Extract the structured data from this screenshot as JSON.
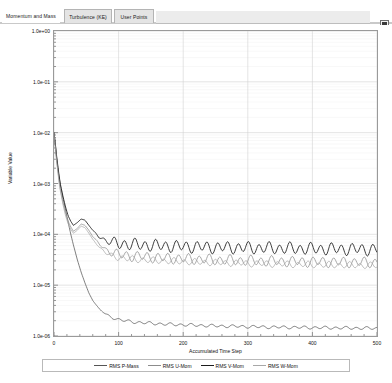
{
  "window": {
    "close_button_icon": "maximize-restore-icon"
  },
  "tabs": [
    {
      "label": "Momentum and Mass",
      "active": true
    },
    {
      "label": "Turbulence (KE)",
      "active": false
    },
    {
      "label": "User Points",
      "active": false
    }
  ],
  "chart_data": {
    "type": "line",
    "title": "",
    "xlabel": "Accumulated Time Step",
    "ylabel": "Variable Value",
    "xlim": [
      0,
      500
    ],
    "ylim": [
      1e-06,
      1.0
    ],
    "yscale": "log",
    "xticks": [
      0,
      100,
      200,
      300,
      400,
      500
    ],
    "xticklabels": [
      "0",
      "100",
      "200",
      "300",
      "400",
      "500"
    ],
    "yticks": [
      1.0,
      0.1,
      0.01,
      0.001,
      0.0001,
      1e-05,
      1e-06
    ],
    "yticklabels": [
      "1.0e+00",
      "1.0e-01",
      "1.0e-02",
      "1.0e-03",
      "1.0e-04",
      "1.0e-05",
      "1.0e-06"
    ],
    "grid": true,
    "legend_position": "bottom",
    "series": [
      {
        "name": "RMS P-Mass",
        "color": "#555555",
        "x": [
          0,
          2,
          4,
          6,
          8,
          10,
          14,
          18,
          22,
          26,
          30,
          36,
          42,
          48,
          54,
          60,
          70,
          80,
          90,
          100,
          115,
          130,
          145,
          160,
          175,
          190,
          205,
          220,
          235,
          250,
          270,
          290,
          310,
          330,
          350,
          370,
          390,
          410,
          430,
          450,
          470,
          490,
          500
        ],
        "y": [
          0.01,
          0.006,
          0.0032,
          0.002,
          0.0013,
          0.0009,
          0.0005,
          0.0003,
          0.00017,
          0.0001,
          6.2e-05,
          3.2e-05,
          1.8e-05,
          1.1e-05,
          7e-06,
          5e-06,
          3.4e-06,
          2.7e-06,
          2.3e-06,
          2.1e-06,
          1.95e-06,
          1.85e-06,
          1.8e-06,
          1.75e-06,
          1.7e-06,
          1.68e-06,
          1.65e-06,
          1.63e-06,
          1.6e-06,
          1.58e-06,
          1.56e-06,
          1.54e-06,
          1.52e-06,
          1.5e-06,
          1.49e-06,
          1.48e-06,
          1.47e-06,
          1.46e-06,
          1.45e-06,
          1.44e-06,
          1.43e-06,
          1.42e-06,
          1.42e-06
        ]
      },
      {
        "name": "RMS U-Mom",
        "color": "#8c8c8c",
        "x": [
          0,
          2,
          4,
          6,
          8,
          10,
          14,
          18,
          22,
          26,
          30,
          36,
          42,
          48,
          54,
          60,
          70,
          80,
          90,
          100,
          115,
          130,
          145,
          160,
          175,
          190,
          205,
          220,
          235,
          250,
          270,
          290,
          310,
          330,
          350,
          370,
          390,
          410,
          430,
          450,
          470,
          490,
          500
        ],
        "y": [
          0.01,
          0.0055,
          0.003,
          0.0018,
          0.0011,
          0.00075,
          0.00042,
          0.00026,
          0.00018,
          0.00014,
          0.000115,
          0.00013,
          0.00016,
          0.00015,
          0.00012,
          9e-05,
          6.5e-05,
          5e-05,
          4.4e-05,
          4e-05,
          3.8e-05,
          3.7e-05,
          3.6e-05,
          3.5e-05,
          3.4e-05,
          3.35e-05,
          3.3e-05,
          3.25e-05,
          3.2e-05,
          3.15e-05,
          3.1e-05,
          3.05e-05,
          3e-05,
          2.98e-05,
          2.95e-05,
          2.92e-05,
          2.9e-05,
          2.88e-05,
          2.86e-05,
          2.84e-05,
          2.82e-05,
          2.8e-05,
          2.8e-05
        ]
      },
      {
        "name": "RMS V-Mom",
        "color": "#1c1c1c",
        "x": [
          0,
          2,
          4,
          6,
          8,
          10,
          14,
          18,
          22,
          26,
          30,
          36,
          42,
          48,
          54,
          60,
          70,
          80,
          90,
          100,
          115,
          130,
          145,
          160,
          175,
          190,
          205,
          220,
          235,
          250,
          270,
          290,
          310,
          330,
          350,
          370,
          390,
          410,
          430,
          450,
          470,
          490,
          500
        ],
        "y": [
          0.01,
          0.0062,
          0.0035,
          0.0022,
          0.0014,
          0.00095,
          0.00055,
          0.00034,
          0.00023,
          0.00018,
          0.00015,
          0.00017,
          0.0002,
          0.00019,
          0.00015,
          0.00012,
          9e-05,
          7.5e-05,
          7e-05,
          6.6e-05,
          6.4e-05,
          6.2e-05,
          6.1e-05,
          6e-05,
          5.9e-05,
          5.8e-05,
          5.75e-05,
          5.7e-05,
          5.6e-05,
          5.55e-05,
          5.5e-05,
          5.45e-05,
          5.4e-05,
          5.35e-05,
          5.3e-05,
          5.25e-05,
          5.2e-05,
          5.18e-05,
          5.15e-05,
          5.12e-05,
          5.1e-05,
          5.05e-05,
          5.05e-05
        ]
      },
      {
        "name": "RMS W-Mom",
        "color": "#a8a8a8",
        "x": [
          0,
          2,
          4,
          6,
          8,
          10,
          14,
          18,
          22,
          26,
          30,
          36,
          42,
          48,
          54,
          60,
          70,
          80,
          90,
          100,
          115,
          130,
          145,
          160,
          175,
          190,
          205,
          220,
          235,
          250,
          270,
          290,
          310,
          330,
          350,
          370,
          390,
          410,
          430,
          450,
          470,
          490,
          500
        ],
        "y": [
          0.01,
          0.0052,
          0.0028,
          0.0017,
          0.001,
          0.0007,
          0.00038,
          0.00023,
          0.00016,
          0.000125,
          0.000105,
          0.00012,
          0.000145,
          0.000135,
          0.000105,
          8e-05,
          5.6e-05,
          4.3e-05,
          3.8e-05,
          3.5e-05,
          3.3e-05,
          3.2e-05,
          3.1e-05,
          3.05e-05,
          3e-05,
          2.95e-05,
          2.9e-05,
          2.85e-05,
          2.82e-05,
          2.78e-05,
          2.74e-05,
          2.7e-05,
          2.66e-05,
          2.63e-05,
          2.6e-05,
          2.57e-05,
          2.55e-05,
          2.52e-05,
          2.5e-05,
          2.48e-05,
          2.46e-05,
          2.44e-05,
          2.44e-05
        ]
      }
    ],
    "oscillation": {
      "start_x": 60,
      "amplitude_log": 0.085,
      "period": 16
    }
  }
}
